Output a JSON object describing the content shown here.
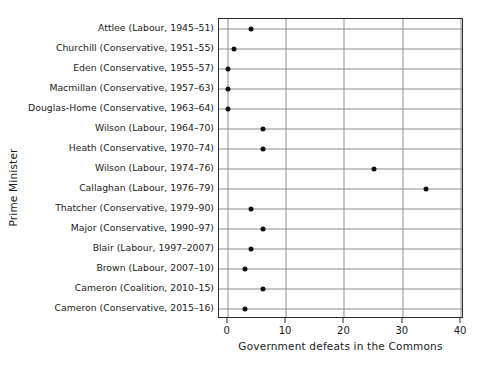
{
  "chart_data": {
    "type": "scatter",
    "title": "",
    "xlabel": "Government defeats in the Commons",
    "ylabel": "Prime Minister",
    "xlim": [
      -1.5,
      40.5
    ],
    "xticks": [
      0,
      10,
      20,
      30,
      40
    ],
    "xticklabels": [
      "0",
      "10",
      "20",
      "30",
      "40"
    ],
    "grid": "both",
    "legend": "none",
    "marker": "filled-circle",
    "marker_color": "#111111",
    "categories": [
      "Attlee (Labour, 1945–51)",
      "Churchill (Conservative, 1951–55)",
      "Eden (Conservative, 1955–57)",
      "Macmillan (Conservative, 1957–63)",
      "Douglas-Home (Conservative, 1963–64)",
      "Wilson (Labour, 1964–70)",
      "Heath (Conservative, 1970–74)",
      "Wilson (Labour, 1974–76)",
      "Callaghan (Labour, 1976–79)",
      "Thatcher (Conservative, 1979–90)",
      "Major (Conservative, 1990–97)",
      "Blair (Labour, 1997–2007)",
      "Brown (Labour, 2007–10)",
      "Cameron (Coalition, 2010–15)",
      "Cameron (Conservative, 2015–16)"
    ],
    "values": [
      4,
      1,
      0,
      0,
      0,
      6,
      6,
      25,
      34,
      4,
      6,
      4,
      3,
      6,
      3
    ]
  }
}
